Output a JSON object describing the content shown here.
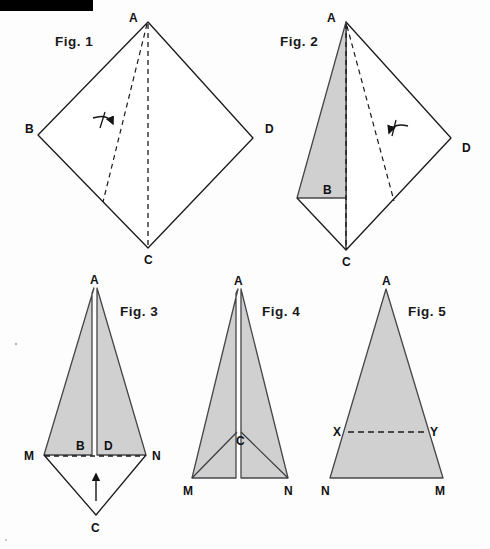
{
  "page": {
    "width": 490,
    "height": 549,
    "background": "#fdfdfd",
    "ink_color": "#1a1a1c",
    "shade_color": "#d0d0d0",
    "shade_stroke": "#5a5a5c",
    "black_bar": {
      "x": 0,
      "y": 0,
      "width": 93,
      "height": 11,
      "color": "#000000"
    }
  },
  "figures": [
    {
      "id": "fig1",
      "caption": "Fig. 1",
      "caption_pos": {
        "x": 55,
        "y": 46
      },
      "description": "Kite ABCD flat, with dashed fold line from A to C and dashed diagonal A to lower-left, curved arrow indicating fold direction",
      "outline_points": "148,22 38,135 148,248 253,138",
      "dashed_lines": [
        {
          "x1": 148,
          "y1": 24,
          "x2": 148,
          "y2": 246
        },
        {
          "x1": 147,
          "y1": 24,
          "x2": 103,
          "y2": 202
        }
      ],
      "arrow": {
        "x": 103,
        "y": 120,
        "dir": "right"
      },
      "labels": [
        {
          "text": "A",
          "x": 129,
          "y": 22
        },
        {
          "text": "B",
          "x": 25,
          "y": 133
        },
        {
          "text": "D",
          "x": 265,
          "y": 133
        },
        {
          "text": "C",
          "x": 144,
          "y": 264
        }
      ]
    },
    {
      "id": "fig2",
      "caption": "Fig. 2",
      "caption_pos": {
        "x": 280,
        "y": 46
      },
      "description": "Kite partially folded: left flap folded over forming shaded triangle, dashed centre line A to C and dashed fold crease, curved arrow",
      "outline_points": "346,22 297,198 346,250 451,138",
      "shaded_points": "346,22 297,198 346,198",
      "dashed_lines": [
        {
          "x1": 346,
          "y1": 24,
          "x2": 346,
          "y2": 248
        },
        {
          "x1": 346,
          "y1": 26,
          "x2": 397,
          "y2": 200
        }
      ],
      "arrow": {
        "x": 396,
        "y": 132,
        "dir": "left"
      },
      "extra_lines": [
        {
          "x1": 297,
          "y1": 198,
          "x2": 346,
          "y2": 250
        },
        {
          "x1": 346,
          "y1": 250,
          "x2": 397,
          "y2": 200
        }
      ],
      "labels": [
        {
          "text": "A",
          "x": 327,
          "y": 22
        },
        {
          "text": "B",
          "x": 325,
          "y": 194
        },
        {
          "text": "D",
          "x": 462,
          "y": 152
        },
        {
          "text": "C",
          "x": 342,
          "y": 266
        }
      ]
    },
    {
      "id": "fig3",
      "caption": "Fig. 3",
      "caption_pos": {
        "x": 120,
        "y": 316
      },
      "description": "Folded kite seen as tall shaded triangle A-M-N split by thin vertical slit, with unshaded triangle M-C-N below and upward arrow",
      "shaded_left": "94,288 44,455 92,455 92,292",
      "shaded_right": "97,292 97,455 146,455 97,288",
      "lower_outline": "44,455 96,515 146,455",
      "dashed_lines": [
        {
          "x1": 45,
          "y1": 456,
          "x2": 145,
          "y2": 456
        }
      ],
      "arrow": {
        "x": 96,
        "y": 492,
        "dir": "up"
      },
      "labels": [
        {
          "text": "A",
          "x": 90,
          "y": 284
        },
        {
          "text": "M",
          "x": 26,
          "y": 459
        },
        {
          "text": "B",
          "x": 77,
          "y": 450
        },
        {
          "text": "D",
          "x": 105,
          "y": 450
        },
        {
          "text": "N",
          "x": 153,
          "y": 459
        },
        {
          "text": "C",
          "x": 92,
          "y": 531
        }
      ]
    },
    {
      "id": "fig4",
      "caption": "Fig. 4",
      "caption_pos": {
        "x": 262,
        "y": 316
      },
      "description": "Fully shaded triangle A-M-N with point C inside, creases from C to M and C to N, thin vertical slit from A down to C",
      "shaded_left": "238,289 192,478 236,478 236,430 236,293",
      "shaded_right": "241,293 241,430 241,478 288,478 241,289",
      "crease_lines": [
        {
          "x1": 238,
          "y1": 432,
          "x2": 192,
          "y2": 478
        },
        {
          "x1": 240,
          "y1": 432,
          "x2": 288,
          "y2": 478
        }
      ],
      "labels": [
        {
          "text": "A",
          "x": 233,
          "y": 285
        },
        {
          "text": "C",
          "x": 236,
          "y": 444
        },
        {
          "text": "M",
          "x": 184,
          "y": 494
        },
        {
          "text": "N",
          "x": 285,
          "y": 494
        }
      ]
    },
    {
      "id": "fig5",
      "caption": "Fig. 5",
      "caption_pos": {
        "x": 408,
        "y": 316
      },
      "description": "Shaded triangle A-N-M with horizontal dashed line X-Y across it",
      "shaded_points": "386,289 330,478 443,478",
      "dashed_lines": [
        {
          "x1": 348,
          "y1": 432,
          "x2": 425,
          "y2": 432
        }
      ],
      "labels": [
        {
          "text": "A",
          "x": 381,
          "y": 285
        },
        {
          "text": "X",
          "x": 334,
          "y": 436
        },
        {
          "text": "Y",
          "x": 430,
          "y": 436
        },
        {
          "text": "N",
          "x": 322,
          "y": 494
        },
        {
          "text": "M",
          "x": 436,
          "y": 494
        }
      ]
    }
  ],
  "specks": [
    {
      "x": 16,
      "y": 344,
      "r": 1.2
    },
    {
      "x": 6,
      "y": 540,
      "r": 1.0
    }
  ]
}
